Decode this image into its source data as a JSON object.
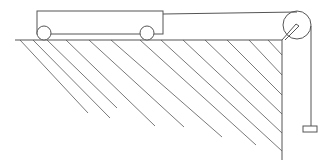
{
  "diagram": {
    "colors": {
      "line": "#555555",
      "hatch": "#6a6a6a",
      "background": "#ffffff"
    },
    "components": {
      "cart": {
        "label": "cart",
        "x": 37,
        "y": 11,
        "width": 126,
        "height": 23
      },
      "wheels": [
        {
          "label": "left-wheel",
          "cx": 44,
          "cy": 33,
          "r": 7
        },
        {
          "label": "right-wheel",
          "cx": 147,
          "cy": 33,
          "r": 7
        }
      ],
      "table_surface": {
        "label": "table-top",
        "x1": 15,
        "y1": 40,
        "x2": 282,
        "y2": 40
      },
      "table_edge": {
        "label": "table-edge",
        "x": 282,
        "y1": 40,
        "y2": 160
      },
      "pulley": {
        "label": "pulley",
        "cx": 297,
        "cy": 25,
        "r": 14
      },
      "string": {
        "label": "string"
      },
      "hanging_mass": {
        "label": "hanging-block",
        "x": 302,
        "y": 126,
        "width": 14,
        "height": 6
      }
    }
  }
}
